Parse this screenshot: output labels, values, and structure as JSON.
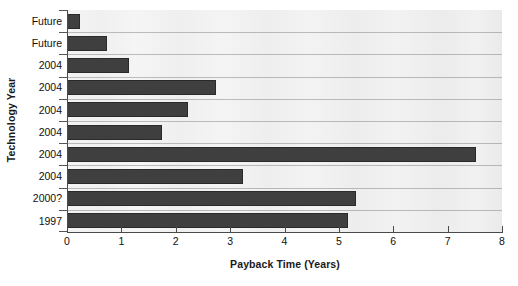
{
  "chart_data": {
    "type": "bar",
    "orientation": "horizontal",
    "title": "",
    "xlabel": "Payback Time (Years)",
    "ylabel": "Technology Year",
    "categories": [
      "Future",
      "Future",
      "2004",
      "2004",
      "2004",
      "2004",
      "2004",
      "2004",
      "2000?",
      "1997"
    ],
    "values": [
      0.22,
      0.72,
      1.12,
      2.72,
      2.2,
      1.72,
      7.5,
      3.22,
      5.3,
      5.15
    ],
    "xlim": [
      0,
      8
    ],
    "xticks": [
      0,
      1,
      2,
      3,
      4,
      5,
      6,
      7,
      8
    ],
    "xtick_labels": [
      "0",
      "1",
      "2",
      "3",
      "4",
      "5",
      "6",
      "7",
      "8"
    ],
    "grid": "horizontal",
    "legend": null,
    "bar_color": "#3f3f3f",
    "plot_background": "#f1f1f1",
    "axis_color": "#4a4a4a"
  }
}
